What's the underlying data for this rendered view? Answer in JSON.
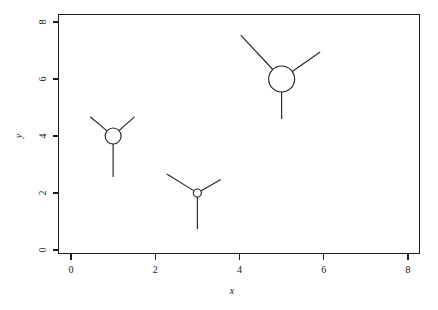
{
  "chart_data": {
    "type": "scatter",
    "title": "",
    "subtitle": "",
    "xlabel": "x",
    "ylabel": "y",
    "xlim": [
      -0.3,
      8.3
    ],
    "ylim": [
      -0.5,
      8.5
    ],
    "xticks": [
      0,
      2,
      4,
      6,
      8
    ],
    "yticks": [
      0,
      2,
      4,
      6,
      8
    ],
    "xticklabels": [
      "0",
      "2",
      "4",
      "6",
      "8"
    ],
    "yticklabels": [
      "0",
      "2",
      "4",
      "6",
      "8"
    ],
    "grid": false,
    "legend": null,
    "marker_style": "circle-with-three-rays",
    "points": [
      {
        "label": "point-1",
        "x": 1,
        "y": 4,
        "radius_px": 8,
        "rays": [
          {
            "name": "upper-left-ray",
            "angle_deg": 140,
            "length_px": 22
          },
          {
            "name": "upper-right-ray",
            "angle_deg": 42,
            "length_px": 21
          },
          {
            "name": "down-ray",
            "angle_deg": 270,
            "length_px": 33
          }
        ]
      },
      {
        "label": "point-2",
        "x": 3,
        "y": 2,
        "radius_px": 4,
        "rays": [
          {
            "name": "upper-left-ray",
            "angle_deg": 148,
            "length_px": 32
          },
          {
            "name": "upper-right-ray",
            "angle_deg": 30,
            "length_px": 23
          },
          {
            "name": "down-ray",
            "angle_deg": 270,
            "length_px": 32
          }
        ]
      },
      {
        "label": "point-3",
        "x": 5,
        "y": 6,
        "radius_px": 13,
        "rays": [
          {
            "name": "upper-left-ray",
            "angle_deg": 133,
            "length_px": 47
          },
          {
            "name": "upper-right-ray",
            "angle_deg": 35,
            "length_px": 34
          },
          {
            "name": "down-ray",
            "angle_deg": 270,
            "length_px": 27
          }
        ]
      }
    ],
    "axis_color": "#1a1a1a",
    "marker_color": "#262626",
    "background_color": "#ffffff"
  },
  "axes": {
    "x_title": "x",
    "y_title": "y"
  }
}
